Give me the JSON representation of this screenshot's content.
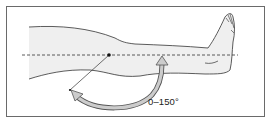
{
  "figure": {
    "range_label": "0–150°",
    "colors": {
      "frame": "#6a6a6a",
      "leg_fill": "#efefef",
      "outline": "#333333",
      "arrow_fill": "#c8c8c8",
      "arrow_stroke": "#555555",
      "reference_line": "#333333"
    }
  }
}
